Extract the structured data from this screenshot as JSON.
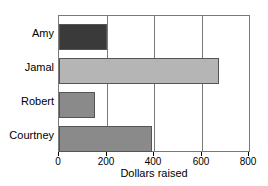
{
  "chart_data": {
    "type": "bar",
    "orientation": "horizontal",
    "title": "",
    "xlabel": "Dollars raised",
    "ylabel": "",
    "categories": [
      "Amy",
      "Jamal",
      "Robert",
      "Courtney"
    ],
    "values": [
      200,
      675,
      150,
      390
    ],
    "series": [
      {
        "name": "Dollars raised",
        "values": [
          200,
          675,
          150,
          390
        ]
      }
    ],
    "bar_colors": [
      "#3a3a3a",
      "#b5b5b5",
      "#8a8a8a",
      "#8a8a8a"
    ],
    "xlim": [
      0,
      800
    ],
    "xticks": [
      0,
      200,
      400,
      600,
      800
    ],
    "xtick_labels": [
      "0",
      "200",
      "400",
      "600",
      "800"
    ],
    "grid": true,
    "grid_axis": "x",
    "gridline_values": [
      200,
      400,
      600
    ],
    "legend": false,
    "legend_position": "none",
    "axis_color": "#7a7a7a",
    "bar_edge_color": "#555555",
    "background_color": "#ffffff",
    "text_color": "#000000"
  }
}
